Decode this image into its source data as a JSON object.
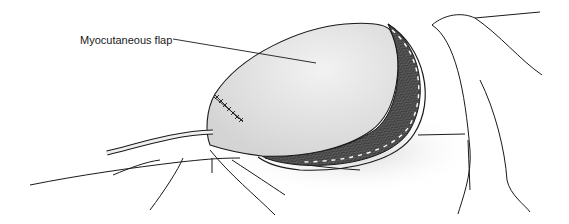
{
  "figure": {
    "annotations": [
      {
        "id": "flap",
        "text": "Myocutaneous flap"
      }
    ]
  },
  "colors": {
    "line": "#1a1a1a",
    "flap_fill": "#e4e4e4",
    "shadow": "#d6d6d6",
    "muscle": "#555555",
    "background": "#ffffff"
  }
}
